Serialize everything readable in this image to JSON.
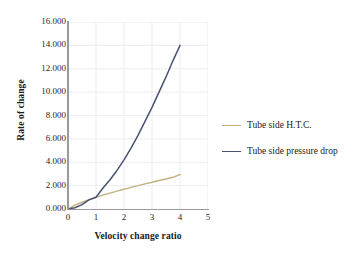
{
  "chart_data": {
    "type": "line",
    "title": "",
    "xlabel": "Velocity change ratio",
    "ylabel": "Rate of change",
    "xlim": [
      0,
      5
    ],
    "ylim": [
      0,
      16
    ],
    "grid": true,
    "legend_position": "right",
    "x_ticks": [
      "0",
      "1",
      "2",
      "3",
      "4",
      "5"
    ],
    "x_tick_values": [
      0,
      1,
      2,
      3,
      4,
      5
    ],
    "y_ticks": [
      "0.000",
      "2.000",
      "4.000",
      "6.000",
      "8.000",
      "10.000",
      "12.000",
      "14.000",
      "16.000"
    ],
    "y_tick_values": [
      0,
      2,
      4,
      6,
      8,
      10,
      12,
      14,
      16
    ],
    "x": [
      0,
      0.25,
      0.5,
      0.75,
      1,
      1.25,
      1.5,
      1.75,
      2,
      2.25,
      2.5,
      2.75,
      3,
      3.25,
      3.5,
      3.75,
      4
    ],
    "series": [
      {
        "name": "Tube side H.T.C.",
        "color": "#c2b280",
        "values": [
          0,
          0.33,
          0.58,
          0.8,
          1.0,
          1.19,
          1.36,
          1.53,
          1.69,
          1.85,
          2.0,
          2.15,
          2.29,
          2.43,
          2.57,
          2.71,
          2.95
        ]
      },
      {
        "name": "Tube side pressure drop",
        "color": "#4a5274",
        "values": [
          0,
          0.11,
          0.38,
          0.78,
          1.0,
          1.8,
          2.5,
          3.3,
          4.2,
          5.2,
          6.3,
          7.5,
          8.7,
          10.0,
          11.3,
          12.7,
          14.0
        ]
      }
    ]
  },
  "legend": {
    "entries": [
      {
        "label": "Tube side H.T.C.",
        "color": "#c2b280"
      },
      {
        "label": "Tube side pressure drop",
        "color": "#4a5274"
      }
    ]
  },
  "colors": {
    "htc_line": "#c2b280",
    "pressure_drop_line": "#4a5274",
    "axis": "#9a9a9a",
    "grid": "#ededf2",
    "text": "#1a1a1a",
    "background": "#ffffff"
  }
}
